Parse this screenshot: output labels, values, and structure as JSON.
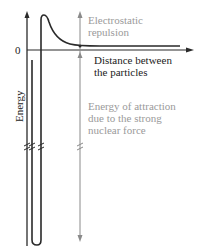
{
  "diagram": {
    "zero_label": "0",
    "y_axis_label": "Energy",
    "x_axis_label_line1": "Distance between",
    "x_axis_label_line2": "the particles",
    "repulsion_label_line1": "Electrostatic",
    "repulsion_label_line2": "repulsion",
    "attraction_label_line1": "Energy of attraction",
    "attraction_label_line2": "due to the strong",
    "attraction_label_line3": "nuclear force",
    "colors": {
      "curve": "#2a2a2a",
      "axis": "#2a2a2a",
      "arrow_gray": "#8a8a8a",
      "label_gray": "#9a9a9a"
    }
  }
}
